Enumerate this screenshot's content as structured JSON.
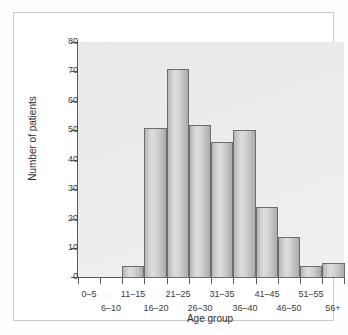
{
  "chart_data": {
    "type": "bar",
    "title": "",
    "subtitle": "",
    "xlabel": "Age group",
    "ylabel": "Number of patients",
    "categories": [
      "0–5",
      "6–10",
      "11–15",
      "16–20",
      "21–25",
      "26–30",
      "31–35",
      "36–40",
      "41–45",
      "46–50",
      "51–55",
      "56+"
    ],
    "values": [
      0,
      0,
      4,
      51,
      71,
      52,
      46,
      50,
      24,
      14,
      4,
      5
    ],
    "ylim": [
      0,
      80
    ],
    "yticks": [
      0,
      10,
      20,
      30,
      40,
      50,
      60,
      70,
      80
    ],
    "ytick_labels": [
      "0",
      "10",
      "20",
      "30",
      "40",
      "50",
      "60",
      "70",
      "80"
    ],
    "grid": false,
    "legend": "none",
    "bar_fill_color": "#d0d0d0",
    "bar_edge_color": "#6d6d6d",
    "plot_background_color": "#ececec",
    "panel_background_color": "#ffffff",
    "axis_color": "#5a5a5a",
    "text_color": "#2e2e2e"
  }
}
